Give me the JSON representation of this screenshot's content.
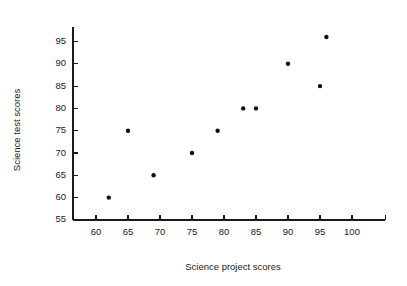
{
  "chart_data": {
    "type": "scatter",
    "title": "",
    "xlabel": "Science project scores",
    "ylabel": "Science test scores",
    "xlim": [
      56,
      106
    ],
    "ylim": [
      55,
      98
    ],
    "xticks": [
      60,
      65,
      70,
      75,
      80,
      85,
      90,
      95,
      100
    ],
    "yticks": [
      55,
      60,
      65,
      70,
      75,
      80,
      85,
      90,
      95
    ],
    "xtick_labels": [
      "60",
      "65",
      "70",
      "75",
      "80",
      "85",
      "90",
      "95",
      "100"
    ],
    "ytick_labels": [
      "55",
      "60",
      "65",
      "70",
      "75",
      "80",
      "85",
      "90",
      "95"
    ],
    "grid": false,
    "legend": false,
    "x": [
      62,
      65,
      69,
      75,
      79,
      83,
      85,
      90,
      95,
      96
    ],
    "y": [
      60,
      75,
      65,
      70,
      75,
      80,
      80,
      90,
      85,
      96
    ],
    "points": [
      {
        "x": 62,
        "y": 60
      },
      {
        "x": 65,
        "y": 75
      },
      {
        "x": 69,
        "y": 65
      },
      {
        "x": 75,
        "y": 70
      },
      {
        "x": 79,
        "y": 75
      },
      {
        "x": 83,
        "y": 80
      },
      {
        "x": 85,
        "y": 80
      },
      {
        "x": 90,
        "y": 90
      },
      {
        "x": 95,
        "y": 85
      },
      {
        "x": 96,
        "y": 96
      }
    ],
    "marker": "filled-circle",
    "marker_color": "#111111",
    "axis_color": "#1a1a1a",
    "background_color": "#ffffff"
  }
}
